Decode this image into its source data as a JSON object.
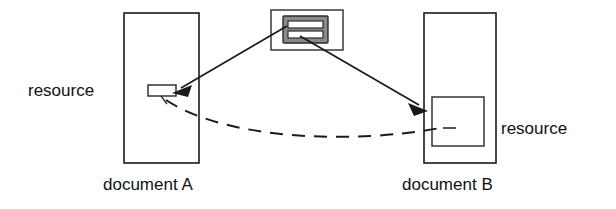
{
  "diagram": {
    "colors": {
      "stroke": "#1a1a1a",
      "icon_fill": "#8a8a8a",
      "background": "#ffffff",
      "bar_fill": "#ffffff"
    },
    "labels": {
      "resource_left": "resource",
      "resource_right": "resource",
      "document_a": "document A",
      "document_b": "document B"
    },
    "nodes": {
      "document_a": {
        "name": "document A",
        "x": 124,
        "y": 13,
        "width": 75,
        "height": 150
      },
      "document_b": {
        "name": "document B",
        "x": 424,
        "y": 13,
        "width": 72,
        "height": 150
      },
      "resource_a": {
        "name": "resource in document A",
        "x": 148,
        "y": 85,
        "width": 28,
        "height": 11
      },
      "resource_b": {
        "name": "resource in document B",
        "x": 432,
        "y": 97,
        "width": 52,
        "height": 49
      },
      "link_icon": {
        "name": "link resource icon",
        "x": 271,
        "y": 10,
        "width": 72,
        "height": 40
      }
    },
    "connectors": [
      {
        "name": "arrow-icon-to-resource-a",
        "type": "solid-arrow",
        "from": "link-icon",
        "to": "resource-a"
      },
      {
        "name": "arrow-icon-to-resource-b",
        "type": "solid-arrow",
        "from": "link-icon",
        "to": "resource-b"
      },
      {
        "name": "dashed-link-a-to-b",
        "type": "dashed-curve",
        "from": "resource-a",
        "to": "resource-b"
      }
    ]
  }
}
